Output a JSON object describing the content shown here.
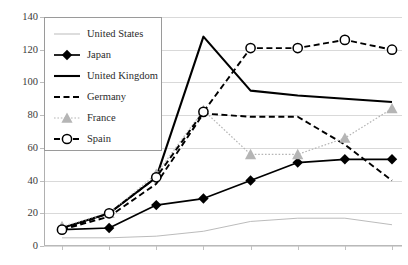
{
  "chart_data": {
    "type": "line",
    "title": "",
    "xlabel": "",
    "ylabel": "",
    "ylim": [
      0,
      140
    ],
    "ytick_step": 20,
    "ytick_labels": [
      "140",
      "120",
      "100",
      "80",
      "60",
      "40",
      "20",
      "0"
    ],
    "xtick_labels": [
      "",
      "",
      "",
      "",
      "",
      "",
      "",
      ""
    ],
    "x_count": 8,
    "grid": true,
    "legend_position": "top-left",
    "legend_border": true,
    "categories": [
      1,
      2,
      3,
      4,
      5,
      6,
      7,
      8
    ],
    "series": [
      {
        "name": "United States",
        "color": "#b3b3b3",
        "style": "solid-thin",
        "marker": "none",
        "values": [
          5,
          5,
          6,
          9,
          15,
          17,
          17,
          13
        ]
      },
      {
        "name": "Japan",
        "color": "#000000",
        "style": "solid",
        "marker": "diamond-filled",
        "values": [
          10,
          11,
          25,
          29,
          40,
          51,
          53,
          53
        ]
      },
      {
        "name": "United Kingdom",
        "color": "#000000",
        "style": "solid-thick",
        "marker": "none",
        "values": [
          11,
          20,
          42,
          128,
          95,
          92,
          90,
          88
        ]
      },
      {
        "name": "Germany",
        "color": "#000000",
        "style": "dashed",
        "marker": "none",
        "values": [
          10,
          18,
          38,
          81,
          79,
          79,
          62,
          40
        ]
      },
      {
        "name": "France",
        "color": "#b5b5b5",
        "style": "dotted",
        "marker": "triangle-filled",
        "values": [
          12,
          20,
          44,
          83,
          56,
          56,
          66,
          84
        ]
      },
      {
        "name": "Spain",
        "color": "#000000",
        "style": "dashed",
        "marker": "circle-open",
        "values": [
          10,
          20,
          42,
          82,
          121,
          121,
          126,
          120
        ]
      }
    ]
  }
}
